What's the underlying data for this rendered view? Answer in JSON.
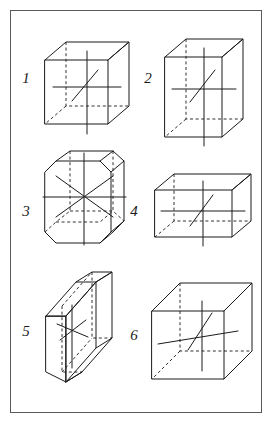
{
  "plate": {
    "title": "Crystal system unit cells with crystallographic axes",
    "border_color": "#5a5a5a",
    "background_color": "#ffffff",
    "line_color": "#1a1a1a",
    "figure_count": 6
  },
  "figures": [
    {
      "number": "1",
      "name": "cubic-cell",
      "shape": "cube",
      "axes": 3,
      "label_x": 26,
      "label_y": 83
    },
    {
      "number": "2",
      "name": "tetragonal-cell",
      "shape": "square-prism",
      "axes": 3,
      "label_x": 148,
      "label_y": 83
    },
    {
      "number": "3",
      "name": "hexagonal-cell",
      "shape": "hexagonal-prism",
      "axes": 4,
      "label_x": 26,
      "label_y": 216
    },
    {
      "number": "4",
      "name": "orthorhombic-cell",
      "shape": "rectangular-box",
      "axes": 3,
      "label_x": 134,
      "label_y": 216
    },
    {
      "number": "5",
      "name": "triclinic-cell",
      "shape": "oblique-slab",
      "axes": 3,
      "label_x": 26,
      "label_y": 336
    },
    {
      "number": "6",
      "name": "monoclinic-cell",
      "shape": "sheared-box",
      "axes": 3,
      "label_x": 134,
      "label_y": 340
    }
  ]
}
